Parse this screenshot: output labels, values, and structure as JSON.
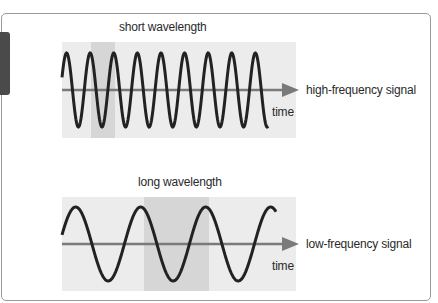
{
  "top_panel": {
    "title": "short wavelength",
    "signal_label": "high-frequency signal",
    "axis_label": "time",
    "wavelength_band": {
      "x_start": 91,
      "x_end": 115
    }
  },
  "bottom_panel": {
    "title": "long wavelength",
    "signal_label": "low-frequency signal",
    "axis_label": "time",
    "wavelength_band": {
      "x_start": 144,
      "x_end": 209
    }
  },
  "colors": {
    "panel_bg": "#ececec",
    "band_bg": "#d6d6d6",
    "wave": "#222222",
    "axis": "#7a7a7a",
    "tab": "#4a4a4a",
    "border": "#9a9a9a"
  }
}
